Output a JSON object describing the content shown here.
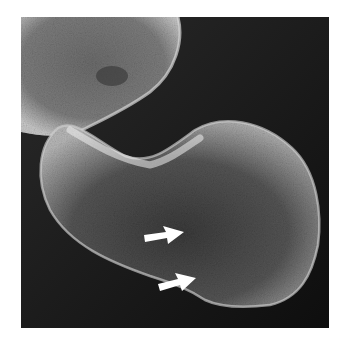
{
  "figure": {
    "type": "scanning-electron-micrograph",
    "background_color": "#161616",
    "subjects": [
      {
        "name": "upper-cell",
        "description": "partially visible rounded cell, top-left"
      },
      {
        "name": "lower-cell",
        "description": "large kidney-shaped cell with textured surface, center"
      }
    ],
    "annotations": [
      {
        "name": "arrow-1",
        "color": "#ffffff",
        "direction": "right",
        "tail": [
          144,
          238
        ],
        "tip": [
          184,
          232
        ]
      },
      {
        "name": "arrow-2",
        "color": "#ffffff",
        "direction": "right",
        "tail": [
          158,
          287
        ],
        "tip": [
          196,
          278
        ]
      }
    ]
  }
}
